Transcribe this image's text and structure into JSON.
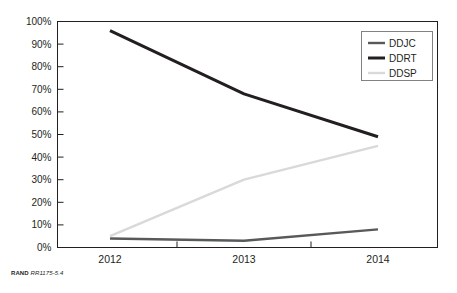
{
  "credit": {
    "brand": "RAND",
    "id": "RR1175-5.4"
  },
  "legend": {
    "position": "top-right",
    "entries": [
      {
        "label": "DDJC",
        "color": "#58595b",
        "width": 2.4
      },
      {
        "label": "DDRT",
        "color": "#231f20",
        "width": 3.0
      },
      {
        "label": "DDSP",
        "color": "#d9d9d9",
        "width": 2.4
      }
    ]
  },
  "axes": {
    "y_ticks": [
      "0%",
      "10%",
      "20%",
      "30%",
      "40%",
      "50%",
      "60%",
      "70%",
      "80%",
      "90%",
      "100%"
    ],
    "x_ticks": [
      "2012",
      "2013",
      "2014"
    ]
  },
  "chart_data": {
    "type": "line",
    "title": "",
    "subtitle": "",
    "xlabel": "",
    "ylabel": "",
    "x": [
      "2012",
      "2013",
      "2014"
    ],
    "categories": [
      "2012",
      "2013",
      "2014"
    ],
    "ylim": [
      0,
      100
    ],
    "y_tick_values": [
      0,
      10,
      20,
      30,
      40,
      50,
      60,
      70,
      80,
      90,
      100
    ],
    "y_tick_labels": [
      "0%",
      "10%",
      "20%",
      "30%",
      "40%",
      "50%",
      "60%",
      "70%",
      "80%",
      "90%",
      "100%"
    ],
    "grid": false,
    "legend_position": "top-right",
    "units": "percent",
    "series": [
      {
        "name": "DDJC",
        "color": "#58595b",
        "values": [
          4,
          3,
          8
        ]
      },
      {
        "name": "DDRT",
        "color": "#231f20",
        "values": [
          96,
          68,
          49
        ]
      },
      {
        "name": "DDSP",
        "color": "#d9d9d9",
        "values": [
          5,
          30,
          45
        ]
      }
    ]
  }
}
